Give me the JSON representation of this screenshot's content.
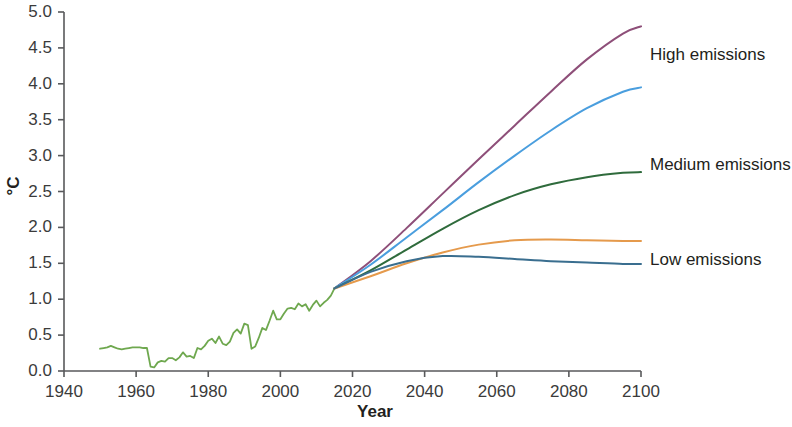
{
  "chart_data": {
    "type": "line",
    "title": "",
    "xlabel": "Year",
    "ylabel": "°C",
    "xlim": [
      1940,
      2100
    ],
    "ylim": [
      0.0,
      5.0
    ],
    "grid": false,
    "legend_position": "right-inline-labels",
    "xticks": [
      "1940",
      "1960",
      "1980",
      "2000",
      "2020",
      "2040",
      "2060",
      "2080",
      "2100"
    ],
    "xtick_values": [
      1940,
      1960,
      1980,
      2000,
      2020,
      2040,
      2060,
      2080,
      2100
    ],
    "yticks": [
      "0.0",
      "0.5",
      "1.0",
      "1.5",
      "2.0",
      "2.5",
      "3.0",
      "3.5",
      "4.0",
      "4.5",
      "5.0"
    ],
    "ytick_values": [
      0.0,
      0.5,
      1.0,
      1.5,
      2.0,
      2.5,
      3.0,
      3.5,
      4.0,
      4.5,
      5.0
    ],
    "series": [
      {
        "name": "Historical observations",
        "color": "#6fa84f",
        "label": "",
        "x": [
          1950,
          1951,
          1952,
          1953,
          1954,
          1955,
          1956,
          1957,
          1958,
          1959,
          1960,
          1961,
          1962,
          1963,
          1964,
          1965,
          1966,
          1967,
          1968,
          1969,
          1970,
          1971,
          1972,
          1973,
          1974,
          1975,
          1976,
          1977,
          1978,
          1979,
          1980,
          1981,
          1982,
          1983,
          1984,
          1985,
          1986,
          1987,
          1988,
          1989,
          1990,
          1991,
          1992,
          1993,
          1994,
          1995,
          1996,
          1997,
          1998,
          1999,
          2000,
          2001,
          2002,
          2003,
          2004,
          2005,
          2006,
          2007,
          2008,
          2009,
          2010,
          2011,
          2012,
          2013,
          2014,
          2015
        ],
        "y": [
          0.31,
          0.32,
          0.33,
          0.35,
          0.33,
          0.31,
          0.3,
          0.31,
          0.32,
          0.33,
          0.33,
          0.33,
          0.32,
          0.32,
          0.06,
          0.05,
          0.12,
          0.14,
          0.13,
          0.18,
          0.18,
          0.15,
          0.19,
          0.26,
          0.2,
          0.21,
          0.18,
          0.32,
          0.3,
          0.35,
          0.42,
          0.45,
          0.39,
          0.48,
          0.38,
          0.36,
          0.41,
          0.53,
          0.58,
          0.52,
          0.66,
          0.64,
          0.31,
          0.34,
          0.46,
          0.6,
          0.57,
          0.7,
          0.84,
          0.72,
          0.72,
          0.8,
          0.87,
          0.88,
          0.86,
          0.94,
          0.9,
          0.93,
          0.84,
          0.92,
          0.98,
          0.9,
          0.95,
          0.99,
          1.05,
          1.15
        ]
      },
      {
        "name": "High emissions",
        "color": "#8e4f79",
        "label": "High emissions",
        "label_temp_2100": 4.8,
        "x": [
          2015,
          2025,
          2035,
          2045,
          2055,
          2065,
          2075,
          2085,
          2095,
          2100
        ],
        "y": [
          1.15,
          1.53,
          1.99,
          2.47,
          2.95,
          3.42,
          3.89,
          4.34,
          4.7,
          4.8
        ]
      },
      {
        "name": "High-medium emissions",
        "color": "#4a9ede",
        "label": "",
        "label_temp_2100": 3.95,
        "x": [
          2015,
          2025,
          2035,
          2045,
          2055,
          2065,
          2075,
          2085,
          2095,
          2100
        ],
        "y": [
          1.15,
          1.48,
          1.86,
          2.24,
          2.63,
          3.0,
          3.35,
          3.66,
          3.89,
          3.95
        ]
      },
      {
        "name": "Medium emissions",
        "color": "#2f6b3c",
        "label": "Medium emissions",
        "label_temp_2100": 2.77,
        "x": [
          2015,
          2025,
          2035,
          2045,
          2055,
          2065,
          2075,
          2085,
          2095,
          2100
        ],
        "y": [
          1.15,
          1.4,
          1.69,
          1.98,
          2.24,
          2.45,
          2.6,
          2.7,
          2.76,
          2.77
        ]
      },
      {
        "name": "Low-medium emissions",
        "color": "#e59a4c",
        "label": "",
        "label_temp_2100": 1.81,
        "x": [
          2015,
          2025,
          2035,
          2045,
          2055,
          2065,
          2075,
          2085,
          2095,
          2100
        ],
        "y": [
          1.15,
          1.32,
          1.5,
          1.65,
          1.76,
          1.82,
          1.83,
          1.82,
          1.81,
          1.81
        ]
      },
      {
        "name": "Low emissions",
        "color": "#3a6e8f",
        "label": "Low emissions",
        "label_temp_2100": 1.49,
        "x": [
          2015,
          2025,
          2035,
          2045,
          2055,
          2065,
          2075,
          2085,
          2095,
          2100
        ],
        "y": [
          1.15,
          1.38,
          1.53,
          1.6,
          1.59,
          1.56,
          1.53,
          1.51,
          1.49,
          1.49
        ]
      }
    ],
    "annotations": [
      {
        "text": "High emissions",
        "x": 2100,
        "y": 4.4
      },
      {
        "text": "Medium emissions",
        "x": 2100,
        "y": 2.87
      },
      {
        "text": "Low emissions",
        "x": 2100,
        "y": 1.55
      }
    ]
  },
  "axis": {
    "y_label": "°C",
    "x_label": "Year"
  }
}
